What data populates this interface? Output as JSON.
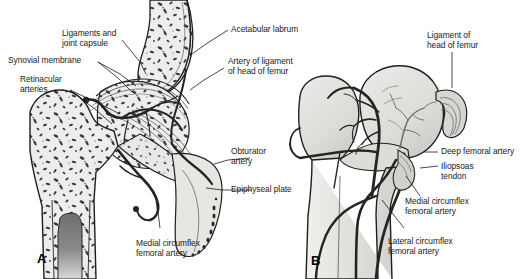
{
  "figure": {
    "background_color": "#ffffff",
    "ink_color": "#1a1a1a",
    "bone_fill": "#e2e2e0",
    "bone_fill_dark": "#c9c9c6",
    "artery_color": "#2b2b2b",
    "marrow_color": "#7a7a78"
  },
  "panels": [
    {
      "id": "A",
      "letter": "A",
      "caption": "Coronal section of the hip joint showing intraosseous blood supply"
    },
    {
      "id": "B",
      "letter": "B",
      "caption": "Anterior view of proximal femur showing extraosseous arterial network"
    }
  ],
  "labels_panel_a": [
    {
      "name": "ligaments-and-joint-capsule",
      "text": "Ligaments and\njoint capsule"
    },
    {
      "name": "synovial-membrane",
      "text": "Synovial membrane"
    },
    {
      "name": "retinacular-arteries",
      "text": "Retinacular\narteries"
    },
    {
      "name": "acetabular-labrum",
      "text": "Acetabular labrum"
    },
    {
      "name": "artery-of-ligament-of-head-of-femur",
      "text": "Artery of ligament\nof head of femur"
    },
    {
      "name": "obturator-artery",
      "text": "Obturator\nartery"
    },
    {
      "name": "epiphyseal-plate",
      "text": "Epiphyseal plate"
    },
    {
      "name": "medial-circumflex-femoral-artery-a",
      "text": "Medial circumflex\nfemoral artery"
    }
  ],
  "labels_panel_b": [
    {
      "name": "ligament-of-head-of-femur",
      "text": "Ligament of\nhead of femur"
    },
    {
      "name": "deep-femoral-artery",
      "text": "Deep femoral artery"
    },
    {
      "name": "iliopsoas-tendon",
      "text": "Iliopsoas\ntendon"
    },
    {
      "name": "medial-circumflex-femoral-artery-b",
      "text": "Medial circumflex\nfemoral artery"
    },
    {
      "name": "lateral-circumflex-femoral-artery",
      "text": "Lateral circumflex\nfemoral artery"
    }
  ]
}
